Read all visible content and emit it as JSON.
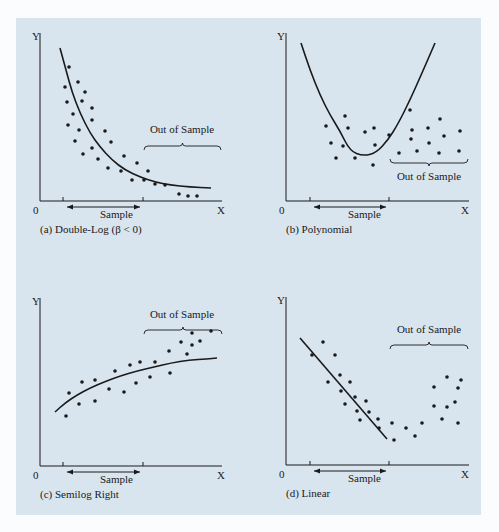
{
  "figure": {
    "background": "#d8e5ef",
    "ink": "#1a1a1a"
  },
  "chart_data": [
    {
      "id": "a",
      "type": "scatter",
      "title": "(a) Double-Log (β < 0)",
      "xlabel": "X",
      "ylabel": "Y",
      "origin_label": "0",
      "sample_label": "Sample",
      "out_of_sample_label": "Out of Sample",
      "fit_curve": "decreasing convex (double-log, β < 0)",
      "frame": {
        "x0": 40,
        "y0": 201,
        "ytop": 33,
        "xend": 222,
        "tick1": 63,
        "tick2": 143,
        "arrow_y": 207,
        "arrow_x1": 67,
        "arrow_x2": 140
      },
      "labels_pos": {
        "y": [
          32,
          40
        ],
        "zero": [
          33,
          214
        ],
        "x": [
          217,
          214
        ],
        "sample": [
          100,
          218
        ],
        "caption": [
          40,
          233
        ]
      },
      "brace": {
        "x1": 144,
        "x2": 221,
        "y": 146,
        "up": false,
        "label_x": 182,
        "label_y": 133
      },
      "curve": [
        [
          60,
          48
        ],
        [
          66,
          70
        ],
        [
          72,
          92
        ],
        [
          80,
          113
        ],
        [
          90,
          133
        ],
        [
          100,
          147
        ],
        [
          112,
          160
        ],
        [
          125,
          170
        ],
        [
          140,
          177
        ],
        [
          155,
          182
        ],
        [
          170,
          185
        ],
        [
          190,
          187
        ],
        [
          211,
          188
        ]
      ],
      "points": [
        [
          69,
          67
        ],
        [
          65,
          87
        ],
        [
          78,
          82
        ],
        [
          85,
          92
        ],
        [
          67,
          102
        ],
        [
          82,
          101
        ],
        [
          92,
          108
        ],
        [
          73,
          114
        ],
        [
          68,
          125
        ],
        [
          79,
          130
        ],
        [
          92,
          120
        ],
        [
          105,
          131
        ],
        [
          75,
          141
        ],
        [
          83,
          154
        ],
        [
          92,
          148
        ],
        [
          98,
          159
        ],
        [
          111,
          142
        ],
        [
          108,
          168
        ],
        [
          121,
          171
        ],
        [
          124,
          156
        ],
        [
          132,
          180
        ],
        [
          137,
          163
        ],
        [
          144,
          180
        ],
        [
          148,
          171
        ],
        [
          155,
          184
        ],
        [
          165,
          185
        ],
        [
          179,
          194
        ],
        [
          188,
          196
        ],
        [
          197,
          196
        ]
      ]
    },
    {
      "id": "b",
      "type": "scatter",
      "title": "(b) Polynomial",
      "xlabel": "X",
      "ylabel": "Y",
      "origin_label": "0",
      "sample_label": "Sample",
      "out_of_sample_label": "Out of Sample",
      "fit_curve": "U-shaped quadratic polynomial",
      "frame": {
        "x0": 286,
        "y0": 201,
        "ytop": 33,
        "xend": 469,
        "tick1": 310,
        "tick2": 389,
        "arrow_y": 207,
        "arrow_x1": 314,
        "arrow_x2": 386
      },
      "labels_pos": {
        "y": [
          277,
          40
        ],
        "zero": [
          279,
          214
        ],
        "x": [
          461,
          214
        ],
        "sample": [
          348,
          218
        ],
        "caption": [
          286,
          233
        ]
      },
      "brace": {
        "x1": 390,
        "x2": 468,
        "y": 163,
        "up": true,
        "label_x": 429,
        "label_y": 180
      },
      "curve": [
        [
          301,
          43
        ],
        [
          310,
          70
        ],
        [
          320,
          95
        ],
        [
          330,
          115
        ],
        [
          340,
          131
        ],
        [
          350,
          151
        ],
        [
          363,
          156
        ],
        [
          376,
          153
        ],
        [
          388,
          140
        ],
        [
          398,
          124
        ],
        [
          410,
          100
        ],
        [
          422,
          73
        ],
        [
          435,
          43
        ]
      ],
      "points": [
        [
          326,
          126
        ],
        [
          331,
          143
        ],
        [
          336,
          158
        ],
        [
          345,
          116
        ],
        [
          348,
          128
        ],
        [
          343,
          146
        ],
        [
          355,
          158
        ],
        [
          365,
          132
        ],
        [
          374,
          128
        ],
        [
          375,
          145
        ],
        [
          373,
          165
        ],
        [
          389,
          135
        ],
        [
          399,
          153
        ],
        [
          410,
          110
        ],
        [
          412,
          130
        ],
        [
          411,
          139
        ],
        [
          417,
          151
        ],
        [
          428,
          128
        ],
        [
          429,
          143
        ],
        [
          440,
          119
        ],
        [
          444,
          136
        ],
        [
          439,
          153
        ],
        [
          460,
          131
        ],
        [
          459,
          151
        ]
      ]
    },
    {
      "id": "c",
      "type": "scatter",
      "title": "(c) Semilog Right",
      "xlabel": "X",
      "ylabel": "Y",
      "origin_label": "0",
      "sample_label": "Sample",
      "out_of_sample_label": "Out of Sample",
      "fit_curve": "increasing concave (semilog right)",
      "frame": {
        "x0": 40,
        "y0": 466,
        "ytop": 298,
        "xend": 222,
        "tick1": 63,
        "tick2": 143,
        "arrow_y": 472,
        "arrow_x1": 67,
        "arrow_x2": 140
      },
      "labels_pos": {
        "y": [
          32,
          305
        ],
        "zero": [
          33,
          479
        ],
        "x": [
          217,
          479
        ],
        "sample": [
          100,
          483
        ],
        "caption": [
          40,
          498
        ]
      },
      "brace": {
        "x1": 144,
        "x2": 222,
        "y": 330,
        "up": false,
        "label_x": 182,
        "label_y": 318
      },
      "curve": [
        [
          55,
          412
        ],
        [
          65,
          403
        ],
        [
          77,
          395
        ],
        [
          90,
          388
        ],
        [
          104,
          382
        ],
        [
          120,
          376
        ],
        [
          137,
          371
        ],
        [
          154,
          367
        ],
        [
          171,
          363
        ],
        [
          189,
          360
        ],
        [
          207,
          359
        ],
        [
          217,
          358
        ]
      ],
      "points": [
        [
          66,
          416
        ],
        [
          69,
          393
        ],
        [
          79,
          404
        ],
        [
          82,
          382
        ],
        [
          95,
          380
        ],
        [
          95,
          401
        ],
        [
          109,
          389
        ],
        [
          115,
          371
        ],
        [
          124,
          392
        ],
        [
          130,
          365
        ],
        [
          136,
          383
        ],
        [
          140,
          362
        ],
        [
          150,
          377
        ],
        [
          155,
          362
        ],
        [
          169,
          351
        ],
        [
          170,
          373
        ],
        [
          181,
          342
        ],
        [
          187,
          354
        ],
        [
          192,
          333
        ],
        [
          192,
          345
        ],
        [
          200,
          341
        ],
        [
          211,
          331
        ]
      ]
    },
    {
      "id": "d",
      "type": "scatter",
      "title": "(d) Linear",
      "xlabel": "X",
      "ylabel": "Y",
      "origin_label": "0",
      "sample_label": "Sample",
      "out_of_sample_label": "Out of Sample",
      "fit_curve": "straight line with negative slope",
      "frame": {
        "x0": 286,
        "y0": 465,
        "ytop": 297,
        "xend": 469,
        "tick1": 310,
        "tick2": 389,
        "arrow_y": 471,
        "arrow_x1": 314,
        "arrow_x2": 386
      },
      "labels_pos": {
        "y": [
          277,
          304
        ],
        "zero": [
          279,
          478
        ],
        "x": [
          461,
          478
        ],
        "sample": [
          348,
          482
        ],
        "caption": [
          286,
          497
        ]
      },
      "brace": {
        "x1": 390,
        "x2": 468,
        "y": 345,
        "up": false,
        "label_x": 429,
        "label_y": 333
      },
      "curve": [
        [
          300,
          338
        ],
        [
          387,
          439
        ]
      ],
      "points": [
        [
          312,
          355
        ],
        [
          323,
          342
        ],
        [
          335,
          355
        ],
        [
          328,
          382
        ],
        [
          340,
          375
        ],
        [
          350,
          382
        ],
        [
          341,
          391
        ],
        [
          345,
          404
        ],
        [
          355,
          397
        ],
        [
          357,
          411
        ],
        [
          366,
          401
        ],
        [
          369,
          412
        ],
        [
          360,
          420
        ],
        [
          378,
          419
        ],
        [
          379,
          428
        ],
        [
          392,
          423
        ],
        [
          394,
          440
        ],
        [
          406,
          428
        ],
        [
          415,
          436
        ],
        [
          422,
          423
        ],
        [
          442,
          419
        ],
        [
          434,
          387
        ],
        [
          434,
          406
        ],
        [
          447,
          407
        ],
        [
          447,
          377
        ],
        [
          458,
          388
        ],
        [
          455,
          402
        ],
        [
          461,
          380
        ],
        [
          458,
          423
        ]
      ]
    }
  ]
}
